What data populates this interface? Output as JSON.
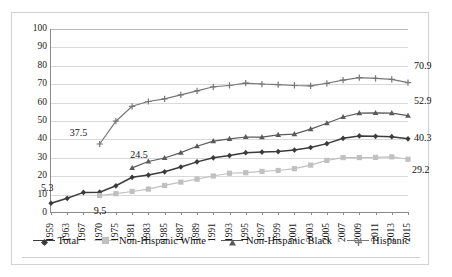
{
  "chart_data": {
    "type": "line",
    "title": "",
    "xlabel": "",
    "ylabel": "",
    "ylim": [
      0,
      100
    ],
    "ytick_step": 10,
    "yticks": [
      0,
      10,
      20,
      30,
      40,
      50,
      60,
      70,
      80,
      90,
      100
    ],
    "grid": "horizontal",
    "legend_position": "bottom",
    "categories": [
      "1959",
      "1963",
      "1967",
      "1970",
      "1975",
      "1981",
      "1983",
      "1985",
      "1987",
      "1989",
      "1991",
      "1993",
      "1995",
      "1997",
      "1999",
      "2001",
      "2003",
      "2005",
      "2007",
      "2009",
      "2011",
      "2013",
      "2015"
    ],
    "series": [
      {
        "name": "Total",
        "color": "#3b3b3b",
        "marker": "diamond",
        "values": [
          5.3,
          8.0,
          11.2,
          11.3,
          14.8,
          19.4,
          20.6,
          22.4,
          25.0,
          27.8,
          30.0,
          31.2,
          32.8,
          33.1,
          33.4,
          34.2,
          35.6,
          37.7,
          40.6,
          41.9,
          41.7,
          41.5,
          40.3
        ]
      },
      {
        "name": "Non-Hispanic White",
        "color": "#c0c0c0",
        "marker": "square",
        "values": [
          null,
          null,
          null,
          9.5,
          10.5,
          11.7,
          13.0,
          15.0,
          16.8,
          18.4,
          20.1,
          21.6,
          21.9,
          22.6,
          23.1,
          24.1,
          26.0,
          28.6,
          30.1,
          30.1,
          30.2,
          30.5,
          29.2
        ]
      },
      {
        "name": "Non-Hispanic Black",
        "color": "#5a5a5a",
        "marker": "triangle",
        "values": [
          null,
          null,
          null,
          null,
          null,
          24.5,
          28.0,
          29.9,
          32.8,
          36.3,
          39.1,
          40.3,
          41.3,
          41.2,
          42.5,
          42.9,
          45.6,
          48.8,
          52.2,
          54.3,
          54.4,
          54.3,
          52.9
        ]
      },
      {
        "name": "Hispanic",
        "color": "#777777",
        "marker": "cross",
        "values": [
          null,
          null,
          null,
          37.5,
          49.9,
          58.0,
          60.6,
          62.0,
          64.2,
          66.4,
          68.6,
          69.3,
          70.6,
          70.1,
          69.8,
          69.3,
          69.1,
          70.5,
          72.2,
          73.6,
          73.2,
          72.6,
          70.9
        ]
      }
    ],
    "annotations": [
      {
        "text": "5.3",
        "series": "Total",
        "at": "1959",
        "value": 5.3
      },
      {
        "text": "9.5",
        "series": "Non-Hispanic White",
        "at": "1970",
        "value": 9.5
      },
      {
        "text": "37.5",
        "series": "Hispanic",
        "at": "1970",
        "value": 37.5
      },
      {
        "text": "24.5",
        "series": "Non-Hispanic Black",
        "at": "1981",
        "value": 24.5
      },
      {
        "text": "70.9",
        "series": "Hispanic",
        "at": "2015",
        "value": 70.9
      },
      {
        "text": "52.9",
        "series": "Non-Hispanic Black",
        "at": "2015",
        "value": 52.9
      },
      {
        "text": "40.3",
        "series": "Total",
        "at": "2015",
        "value": 40.3
      },
      {
        "text": "29.2",
        "series": "Non-Hispanic White",
        "at": "2015",
        "value": 29.2
      }
    ]
  }
}
